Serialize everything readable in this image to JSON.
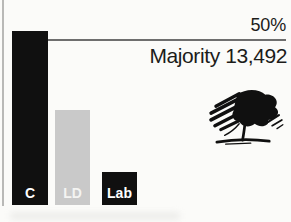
{
  "page": {
    "background": "#fbfbf9",
    "text_color": "#1c1c1a"
  },
  "chart_data": {
    "type": "bar",
    "title": "",
    "xlabel": "",
    "ylabel": "",
    "categories": [
      "C",
      "LD",
      "Lab"
    ],
    "values": [
      52.5,
      28.5,
      10
    ],
    "bar_colors": [
      "#101010",
      "#c9c9c9",
      "#101010"
    ],
    "bar_label_colors": [
      "#ffffff",
      "#f4f4f2",
      "#ffffff"
    ],
    "threshold": {
      "value": 50,
      "label": "50%"
    },
    "annotation": "Majority 13,492",
    "ylim": [
      0,
      62
    ],
    "grid": false,
    "legend": false,
    "threshold_line_color": "#6e6e6e"
  },
  "logo": {
    "name": "conservative-scribble-tree",
    "color": "#101010"
  }
}
